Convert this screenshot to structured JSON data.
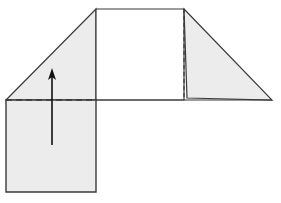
{
  "diagram": {
    "type": "origami-fold-step",
    "colors": {
      "stroke": "#3a3a3a",
      "paper_fill": "#ececec",
      "background": "#ffffff",
      "arrow": "#111111"
    },
    "shapes": {
      "left_triangle_flap": "6,100 96,9 96,100",
      "top_center_square": "96,9 184,9 184,100 96,100",
      "right_folded_flap": "184,9 272,100 187,98",
      "bottom_left_rect": "6,100 96,100 96,192 6,192"
    },
    "lines": {
      "baseline": {
        "x1": 96,
        "y1": 100,
        "x2": 272,
        "y2": 100
      },
      "fold_dashed_horizontal": {
        "x1": 6,
        "y1": 100,
        "x2": 96,
        "y2": 100
      },
      "fold_dashed_vertical": {
        "x1": 184,
        "y1": 9,
        "x2": 184,
        "y2": 98
      }
    },
    "arrow": {
      "direction": "up",
      "x": 52,
      "y_start": 145,
      "y_end": 68
    }
  }
}
